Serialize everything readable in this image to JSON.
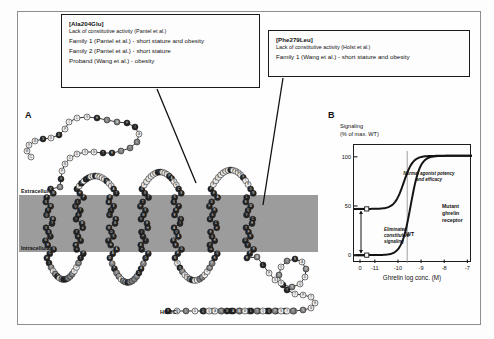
{
  "figure": {
    "panel_a_letter": "A",
    "panel_b_letter": "B"
  },
  "callouts": [
    {
      "id": "ala204glu",
      "header": "[Ala204Glu]",
      "subheader": "Lack of constitutive activity (Pantel et al.)",
      "rows": [
        "Family 1 (Pantel et al.) - short stature and obesity",
        "Family 2 (Pantel et al.) - short stature",
        "Proband (Wang et al.) - obesity"
      ]
    },
    {
      "id": "phe279leu",
      "header": "[Phe279Leu]",
      "subheader": "Lack of constitutive activity (Holst et al.)",
      "rows": [
        "Family 1 (Wang et al.) - short stature and obesity"
      ]
    }
  ],
  "snake_plot": {
    "extracellular_label": "Extracellular",
    "intracellular_label": "Intracellular",
    "c_terminus_label": "HOOC-",
    "membrane_color": "#9c9c9c",
    "residue_dark_color": "#232323",
    "residue_light_color": "#e9e9e9",
    "residue_mid_color": "#7d7d7d"
  },
  "chart_data": {
    "type": "line",
    "title": "",
    "xlabel": "Ghrelin log conc. (M)",
    "ylabel": "Signaling\n(% of max. WT)",
    "ylabel_line1": "Signaling",
    "ylabel_line2": "(% of max. WT)",
    "xticks": [
      "0",
      "-11",
      "-10",
      "-9",
      "-8",
      "-7"
    ],
    "yticks": [
      "0",
      "50",
      "100"
    ],
    "xlim": [
      -11.9,
      -6.8
    ],
    "ylim": [
      -8,
      112
    ],
    "grid": false,
    "legend_position": "inline-annotations",
    "series": [
      {
        "name": "WT",
        "basal": 47,
        "emax": 101,
        "logEC50": -9.75,
        "hill": 1.15,
        "x": [
          -11.6,
          -11.2,
          -10.8,
          -10.4,
          -10.0,
          -9.75,
          -9.5,
          -9.2,
          -8.8,
          -8.4,
          -8.0,
          -7.5,
          -7.0
        ],
        "y": [
          47,
          47,
          47.5,
          49,
          56,
          74,
          88,
          96,
          100,
          101,
          101,
          101,
          101
        ]
      },
      {
        "name": "Mutant ghrelin receptor",
        "basal": 0,
        "emax": 101,
        "logEC50": -9.45,
        "hill": 1.15,
        "x": [
          -11.6,
          -11.2,
          -10.8,
          -10.4,
          -10.0,
          -9.75,
          -9.5,
          -9.2,
          -8.8,
          -8.4,
          -8.0,
          -7.5,
          -7.0
        ],
        "y": [
          0,
          0.5,
          1.5,
          4,
          12,
          26,
          45,
          68,
          89,
          98,
          100.5,
          101,
          101
        ]
      }
    ],
    "annotations": [
      {
        "name": "normal-potency",
        "text": "Normal agonist potency and efficacy",
        "at_x": -9.6
      },
      {
        "name": "eliminated-signaling",
        "text": "Eliminated constitutive signaling"
      },
      {
        "name": "wt-curve-label",
        "text": "WT"
      },
      {
        "name": "mutant-curve-label",
        "text": "Mutant ghrelin receptor"
      }
    ],
    "markers": [
      {
        "series": "WT",
        "x": -11.35,
        "y": 47
      },
      {
        "series": "Mutant ghrelin receptor",
        "x": -11.35,
        "y": 0
      }
    ],
    "vertical_reference_line_x": -9.6
  }
}
